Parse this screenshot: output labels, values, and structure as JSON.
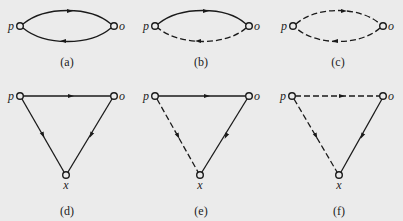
{
  "figure": {
    "background": "#ebebeb",
    "stroke_color": "#1a1a1a",
    "panels": [
      {
        "id": "a",
        "caption": "(a)",
        "shape": "loop",
        "nodes": {
          "p": "p",
          "o": "o"
        },
        "edges": [
          {
            "from": "p",
            "to": "o",
            "style": "solid",
            "path": "upper"
          },
          {
            "from": "o",
            "to": "p",
            "style": "solid",
            "path": "lower"
          }
        ]
      },
      {
        "id": "b",
        "caption": "(b)",
        "shape": "loop",
        "nodes": {
          "p": "p",
          "o": "o"
        },
        "edges": [
          {
            "from": "p",
            "to": "o",
            "style": "solid",
            "path": "upper"
          },
          {
            "from": "o",
            "to": "p",
            "style": "dashed",
            "path": "lower"
          }
        ]
      },
      {
        "id": "c",
        "caption": "(c)",
        "shape": "loop",
        "nodes": {
          "p": "p",
          "o": "o"
        },
        "edges": [
          {
            "from": "p",
            "to": "o",
            "style": "dashed",
            "path": "upper"
          },
          {
            "from": "o",
            "to": "p",
            "style": "dashed",
            "path": "lower"
          }
        ]
      },
      {
        "id": "d",
        "caption": "(d)",
        "shape": "triangle",
        "nodes": {
          "p": "p",
          "o": "o",
          "x": "x"
        },
        "edges": [
          {
            "from": "p",
            "to": "o",
            "style": "solid"
          },
          {
            "from": "p",
            "to": "x",
            "style": "solid"
          },
          {
            "from": "o",
            "to": "x",
            "style": "solid"
          }
        ]
      },
      {
        "id": "e",
        "caption": "(e)",
        "shape": "triangle",
        "nodes": {
          "p": "p",
          "o": "o",
          "x": "x"
        },
        "edges": [
          {
            "from": "p",
            "to": "o",
            "style": "solid"
          },
          {
            "from": "p",
            "to": "x",
            "style": "dashed"
          },
          {
            "from": "o",
            "to": "x",
            "style": "solid"
          }
        ]
      },
      {
        "id": "f",
        "caption": "(f)",
        "shape": "triangle",
        "nodes": {
          "p": "p",
          "o": "o",
          "x": "x"
        },
        "edges": [
          {
            "from": "p",
            "to": "o",
            "style": "dashed"
          },
          {
            "from": "p",
            "to": "x",
            "style": "dashed"
          },
          {
            "from": "o",
            "to": "x",
            "style": "solid"
          }
        ]
      }
    ]
  }
}
